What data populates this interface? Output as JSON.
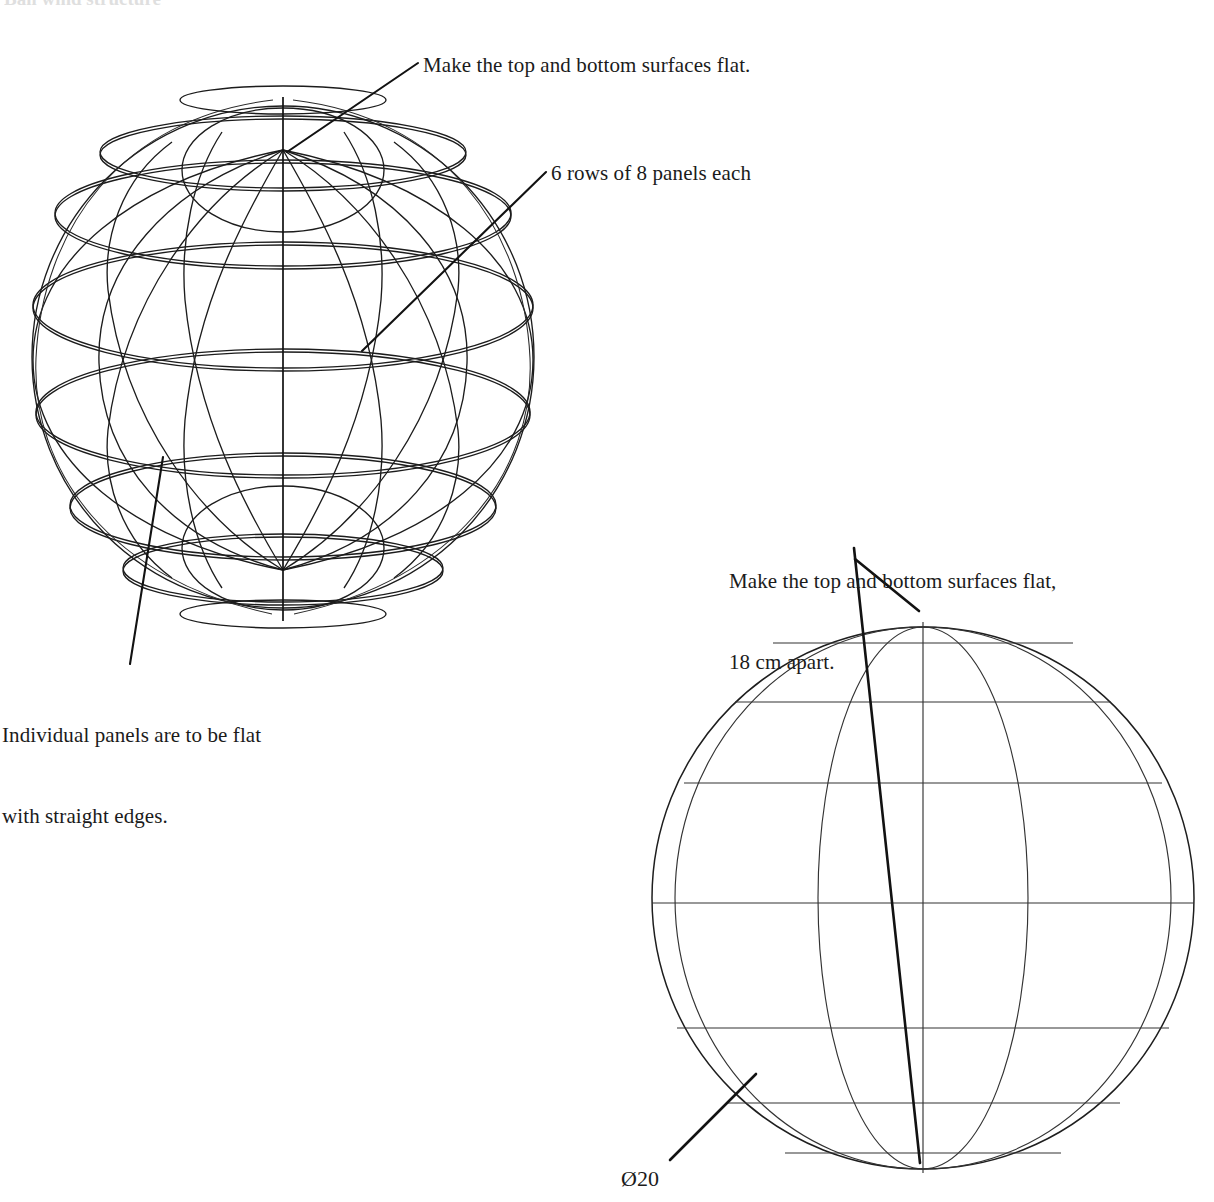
{
  "page": {
    "background_color": "#ffffff",
    "line_color": "#1c1c1c",
    "clipped_header_text": "Ball wind structure"
  },
  "annotations": {
    "top_flat": "Make the top and bottom surfaces flat.",
    "rows_panels": "6 rows of 8 panels each",
    "individual_panels_line1": "Individual panels are to be flat",
    "individual_panels_line2": "with straight edges.",
    "flat_18_line1": "Make the top and bottom surfaces flat,",
    "flat_18_line2": "18 cm apart.",
    "diameter": "Ø20"
  },
  "views": {
    "isometric": {
      "name": "isometric-ball-view",
      "center_x": 283,
      "center_y": 357,
      "radius": 251,
      "rows": 6,
      "panels_per_row": 8,
      "pole_top_y": 150,
      "pole_bottom_y": 570,
      "axis_top_y": 97,
      "axis_bottom_y": 621,
      "latitude_count": 7
    },
    "elevation": {
      "name": "front-elevation-ball-view",
      "center_x": 923,
      "center_y": 898,
      "radius": 271,
      "top_y": 622,
      "bottom_y": 1173,
      "flat_top_chord_y": 643,
      "flat_bottom_chord_y": 1153,
      "latitude_y": [
        643,
        702,
        783,
        903,
        1028,
        1103,
        1153
      ],
      "meridian_half_widths": [
        248,
        105
      ],
      "diameter_label": "Ø20"
    }
  },
  "leaders": {
    "top_flat": {
      "x1": 418,
      "y1": 63,
      "x2": 287,
      "y2": 152
    },
    "rows_panels": {
      "x1": 546,
      "y1": 172,
      "x2": 362,
      "y2": 351
    },
    "individual": {
      "x1": 130,
      "y1": 664,
      "x2": 163,
      "y2": 457
    },
    "flat_18_short": {
      "x1": 855,
      "y1": 559,
      "x2": 919,
      "y2": 611
    },
    "flat_18_long": {
      "x1": 854,
      "y1": 548,
      "x2": 920,
      "y2": 1163
    },
    "diameter": {
      "x1": 670,
      "y1": 1160,
      "x2": 756,
      "y2": 1074
    }
  }
}
